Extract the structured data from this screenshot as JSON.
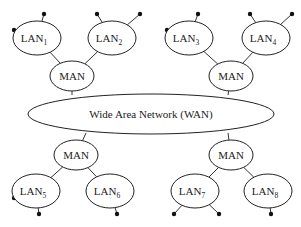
{
  "diagram": {
    "title": "",
    "wan": {
      "label": "Wide Area Network (WAN)",
      "cx": 151,
      "cy": 114,
      "rx": 123,
      "ry": 20
    },
    "mans": [
      {
        "id": "man-top-left",
        "label": "MAN",
        "cx": 72,
        "cy": 76,
        "attach": [
          72,
          95
        ]
      },
      {
        "id": "man-top-right",
        "label": "MAN",
        "cx": 231,
        "cy": 76,
        "attach": [
          228,
          95
        ]
      },
      {
        "id": "man-bottom-left",
        "label": "MAN",
        "cx": 76,
        "cy": 155,
        "attach": [
          86,
          133
        ]
      },
      {
        "id": "man-bottom-right",
        "label": "MAN",
        "cx": 231,
        "cy": 155,
        "attach": [
          228,
          133
        ]
      }
    ],
    "lans": [
      {
        "id": "lan1",
        "label": "LAN",
        "sub": "1",
        "cx": 37,
        "cy": 38,
        "man": 0,
        "hosts": [
          [
            14,
            30
          ],
          [
            44,
            14
          ]
        ]
      },
      {
        "id": "lan2",
        "label": "LAN",
        "sub": "2",
        "cx": 112,
        "cy": 38,
        "man": 0,
        "hosts": [
          [
            97,
            14
          ],
          [
            140,
            14
          ]
        ]
      },
      {
        "id": "lan3",
        "label": "LAN",
        "sub": "3",
        "cx": 189,
        "cy": 38,
        "man": 1,
        "hosts": [
          [
            167,
            30
          ],
          [
            198,
            14
          ]
        ]
      },
      {
        "id": "lan4",
        "label": "LAN",
        "sub": "4",
        "cx": 266,
        "cy": 38,
        "man": 1,
        "hosts": [
          [
            250,
            14
          ],
          [
            292,
            14
          ]
        ]
      },
      {
        "id": "lan5",
        "label": "LAN",
        "sub": "5",
        "cx": 36,
        "cy": 191,
        "man": 2,
        "hosts": [
          [
            14,
            198
          ],
          [
            39,
            214
          ]
        ]
      },
      {
        "id": "lan6",
        "label": "LAN",
        "sub": "6",
        "cx": 110,
        "cy": 191,
        "man": 2,
        "hosts": [
          [
            117,
            214
          ]
        ]
      },
      {
        "id": "lan7",
        "label": "LAN",
        "sub": "7",
        "cx": 195,
        "cy": 191,
        "man": 3,
        "hosts": [
          [
            174,
            214
          ],
          [
            219,
            214
          ]
        ]
      },
      {
        "id": "lan8",
        "label": "LAN",
        "sub": "8",
        "cx": 268,
        "cy": 191,
        "man": 3,
        "hosts": [
          [
            271,
            214
          ]
        ]
      }
    ],
    "lan_radius": {
      "rx": 24,
      "ry": 17
    },
    "man_radius": {
      "rx": 22,
      "ry": 15
    }
  }
}
